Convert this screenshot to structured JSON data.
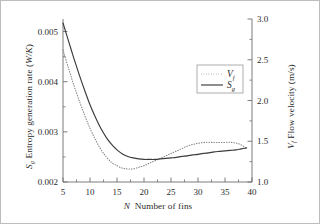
{
  "chart_data": {
    "type": "line",
    "title": "",
    "xlabel": "N  Number of fins",
    "ylabel": "S_g  Entropy generation rate (W/K)",
    "ylabel_right": "V_f  Flow velocity (m/s)",
    "xlim": [
      5,
      40
    ],
    "ylim": [
      0.002,
      0.00525
    ],
    "ylim_right": [
      1.0,
      3.0
    ],
    "xticks": [
      5,
      10,
      15,
      20,
      25,
      30,
      35,
      40
    ],
    "xtick_labels": [
      "5",
      "10",
      "15",
      "20",
      "25",
      "30",
      "35",
      "40"
    ],
    "yticks": [
      0.002,
      0.003,
      0.004,
      0.005
    ],
    "ytick_labels": [
      "0.002",
      "0.003",
      "0.004",
      "0.005"
    ],
    "yticks_right": [
      1.0,
      1.5,
      2.0,
      2.5,
      3.0
    ],
    "ytick_labels_right": [
      "1.0",
      "1.5",
      "2.0",
      "2.5",
      "3.0"
    ],
    "grid": false,
    "legend_position": "upper right",
    "series": [
      {
        "name": "V_f",
        "axis": "right",
        "style": "dotted",
        "color": "#808080",
        "x": [
          5,
          6,
          7,
          8,
          9,
          10,
          11,
          12,
          13,
          14,
          15,
          16,
          17,
          18,
          19,
          20,
          21,
          22,
          23,
          24,
          25,
          26,
          27,
          28,
          29,
          30,
          31,
          32,
          33,
          34,
          35,
          36,
          37,
          38,
          39
        ],
        "values": [
          2.62,
          2.4,
          2.19,
          2.0,
          1.82,
          1.66,
          1.52,
          1.4,
          1.31,
          1.24,
          1.2,
          1.17,
          1.16,
          1.16,
          1.18,
          1.2,
          1.23,
          1.26,
          1.29,
          1.32,
          1.35,
          1.38,
          1.41,
          1.44,
          1.46,
          1.475,
          1.485,
          1.487,
          1.485,
          1.484,
          1.486,
          1.487,
          1.478,
          1.455,
          1.41
        ]
      },
      {
        "name": "S_g",
        "axis": "left",
        "style": "solid",
        "color": "#3b3b3b",
        "x": [
          5,
          6,
          7,
          8,
          9,
          10,
          11,
          12,
          13,
          14,
          15,
          16,
          17,
          18,
          19,
          20,
          21,
          22,
          23,
          24,
          25,
          26,
          27,
          28,
          29,
          30,
          31,
          32,
          33,
          34,
          35,
          36,
          37,
          38,
          39
        ],
        "values": [
          0.00517,
          0.00482,
          0.00447,
          0.00414,
          0.00383,
          0.00354,
          0.00329,
          0.00307,
          0.00289,
          0.00275,
          0.00264,
          0.00256,
          0.00251,
          0.00248,
          0.00246,
          0.00245,
          0.00245,
          0.00245,
          0.00246,
          0.00247,
          0.00248,
          0.00249,
          0.00251,
          0.00252,
          0.00254,
          0.00255,
          0.00257,
          0.00258,
          0.0026,
          0.00261,
          0.00262,
          0.00263,
          0.00264,
          0.00266,
          0.00268
        ]
      }
    ],
    "legend": [
      {
        "label": "V",
        "sub": "f",
        "style": "dotted"
      },
      {
        "label": "S",
        "sub": "g",
        "style": "solid"
      }
    ]
  },
  "axes": {
    "x_axis_title_symbol": "N",
    "x_axis_title_text": "Number of fins",
    "y_left_title_symbol": "S",
    "y_left_title_sub": "g",
    "y_left_title_text": "Entropy generation rate (",
    "y_left_title_unit": "W/K",
    "y_left_title_close": ")",
    "y_right_title_symbol": "V",
    "y_right_title_sub": "f",
    "y_right_title_text": "Flow velocity (m/s)"
  },
  "colors": {
    "frame": "#6e6e6e",
    "text": "#2b2b2b",
    "series_solid": "#3b3b3b",
    "series_dotted": "#8a8a8a",
    "legend_border": "#9a9a9a"
  }
}
